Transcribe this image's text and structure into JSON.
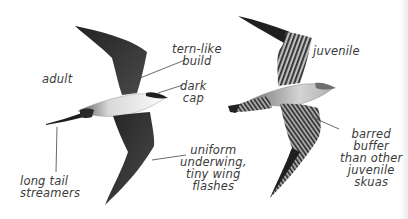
{
  "figure": {
    "birds": [
      {
        "id": "adult",
        "label": "adult"
      },
      {
        "id": "juvenile",
        "label": "juvenile"
      }
    ],
    "annotations": {
      "tern_like": "tern-like\nbuild",
      "dark_cap": "dark\ncap",
      "tail": "long tail\nstreamers",
      "underwing": "uniform\nunderwing,\ntiny wing\nflashes",
      "barred": "barred\nbuffer\nthan other\njuvenile\nskuas"
    },
    "colors": {
      "background": "#ffffff",
      "ink": "#2a2a2a",
      "wing_dark": "#333333",
      "body_light": "#f2f2f2",
      "juvenile_buff": "#9a9a9a",
      "text": "#3a3a3a"
    }
  }
}
